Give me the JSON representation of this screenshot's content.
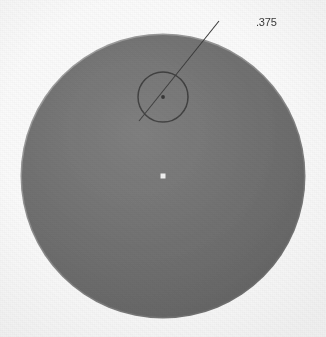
{
  "drawing": {
    "title": "Circular part detail view",
    "background_color": "#fbfbfb",
    "part": {
      "name": "main-disc",
      "shape": "circle",
      "fill_color": "#6f6f6f",
      "edge_color": "#8f8f8f",
      "center": {
        "x": 163,
        "y": 176
      },
      "radius": 142
    },
    "hole": {
      "name": "drilled-hole",
      "shape": "circle",
      "stroke_color": "#3a3a3a",
      "center": {
        "x": 163,
        "y": 97
      },
      "radius": 25
    },
    "centerlines": {
      "stroke_color": "#4a4a4a",
      "horizontal": {
        "x1": 10,
        "y1": 176,
        "x2": 313,
        "y2": 176
      },
      "vertical": {
        "x1": 163,
        "y1": 17,
        "x2": 163,
        "y2": 328
      },
      "center_mark": {
        "x": 163,
        "y": 176,
        "size": 5,
        "color": "#f2f2f2"
      }
    },
    "leader": {
      "stroke_color": "#3a3a3a",
      "horizontal_segment": {
        "x1": 219,
        "y1": 21,
        "x2": 254,
        "y2": 21
      },
      "diagonal_segment": {
        "x1": 219,
        "y1": 21,
        "x2": 139,
        "y2": 121
      },
      "arrow_point": {
        "x": 139,
        "y": 121
      }
    },
    "dimension": {
      "name": "hole-diameter",
      "label": ".375",
      "text_color": "#3b3b3b",
      "position": {
        "x": 257,
        "y": 25
      }
    }
  }
}
